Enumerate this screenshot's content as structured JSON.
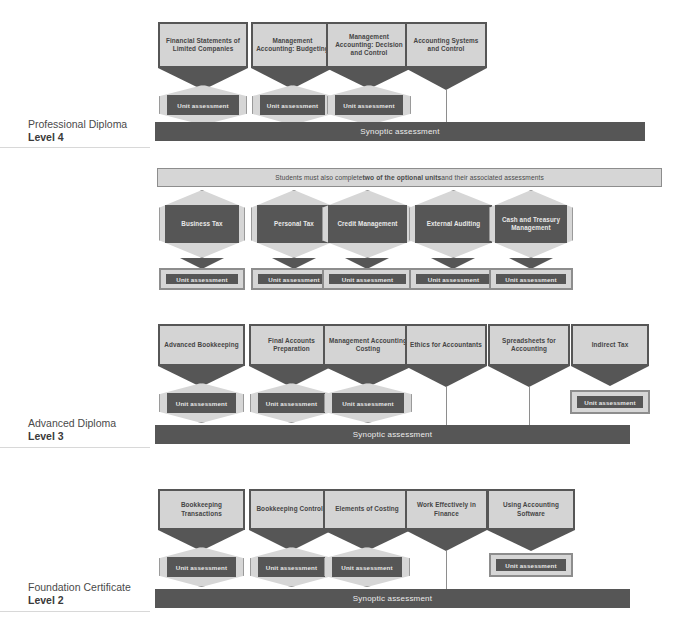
{
  "diagram": {
    "synoptic_label": "Synoptic assessment",
    "unit_assessment_label": "Unit assessment",
    "optional_banner": {
      "prefix": "Students must also complete ",
      "bold": "two of the optional units",
      "suffix": " and their associated assessments"
    },
    "colors": {
      "dark": "#565656",
      "light": "#d6d6d6",
      "unit_fill": "#d4d4d4",
      "text_dark": "#454545",
      "text_light": "#ececec",
      "line": "#8e8e8e"
    }
  },
  "levels": [
    {
      "name": "level-4",
      "title": "Professional Diploma",
      "level": "Level 4",
      "synoptic": true,
      "units": [
        {
          "label": "Financial Statements of Limited Companies",
          "assessment": "hex",
          "assessment_label": "Unit assessment",
          "to_synoptic": true
        },
        {
          "label": "Management Accounting: Budgeting",
          "assessment": "hex",
          "assessment_label": "Unit assessment",
          "to_synoptic": true
        },
        {
          "label": "Management Accounting: Decision and Control",
          "assessment": "hex",
          "assessment_label": "Unit assessment",
          "to_synoptic": true
        },
        {
          "label": "Accounting Systems and Control",
          "assessment": "none",
          "assessment_label": "",
          "to_synoptic": true
        }
      ]
    },
    {
      "name": "optional-units",
      "title": "",
      "level": "",
      "synoptic": false,
      "units": [
        {
          "label": "Business Tax",
          "assessment": "rect",
          "assessment_label": "Unit assessment",
          "to_synoptic": false
        },
        {
          "label": "Personal Tax",
          "assessment": "rect",
          "assessment_label": "Unit assessment",
          "to_synoptic": false
        },
        {
          "label": "Credit Management",
          "assessment": "rect",
          "assessment_label": "Unit assessment",
          "to_synoptic": false
        },
        {
          "label": "External Auditing",
          "assessment": "rect",
          "assessment_label": "Unit assessment",
          "to_synoptic": false
        },
        {
          "label": "Cash and Treasury Management",
          "assessment": "rect",
          "assessment_label": "Unit assessment",
          "to_synoptic": false
        }
      ]
    },
    {
      "name": "level-3",
      "title": "Advanced Diploma",
      "level": "Level 3",
      "synoptic": true,
      "units": [
        {
          "label": "Advanced Bookkeeping",
          "assessment": "hex",
          "assessment_label": "Unit assessment",
          "to_synoptic": true
        },
        {
          "label": "Final Accounts Preparation",
          "assessment": "hex",
          "assessment_label": "Unit assessment",
          "to_synoptic": true
        },
        {
          "label": "Management Accounting Costing",
          "assessment": "hex",
          "assessment_label": "Unit assessment",
          "to_synoptic": true
        },
        {
          "label": "Ethics for Accountants",
          "assessment": "none",
          "assessment_label": "",
          "to_synoptic": true
        },
        {
          "label": "Spreadsheets for Accounting",
          "assessment": "none",
          "assessment_label": "",
          "to_synoptic": true
        },
        {
          "label": "Indirect Tax",
          "assessment": "rect",
          "assessment_label": "Unit assessment",
          "to_synoptic": false
        }
      ]
    },
    {
      "name": "level-2",
      "title": "Foundation Certificate",
      "level": "Level 2",
      "synoptic": true,
      "units": [
        {
          "label": "Bookkeeping Transactions",
          "assessment": "hex",
          "assessment_label": "Unit assessment",
          "to_synoptic": true
        },
        {
          "label": "Bookkeeping Controls",
          "assessment": "hex",
          "assessment_label": "Unit assessment",
          "to_synoptic": true
        },
        {
          "label": "Elements of Costing",
          "assessment": "hex",
          "assessment_label": "Unit assessment",
          "to_synoptic": true
        },
        {
          "label": "Work Effectively in Finance",
          "assessment": "none",
          "assessment_label": "",
          "to_synoptic": true
        },
        {
          "label": "Using Accounting Software",
          "assessment": "rect",
          "assessment_label": "Unit assessment",
          "to_synoptic": false
        }
      ]
    }
  ]
}
